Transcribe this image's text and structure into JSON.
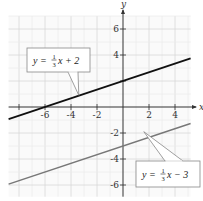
{
  "chart_data": {
    "type": "line",
    "title": "",
    "xlabel": "x",
    "ylabel": "y",
    "xlim": [
      -8.8,
      5.2
    ],
    "ylim": [
      -6.9,
      7
    ],
    "grid": true,
    "x_ticks": [
      -8,
      -6,
      -4,
      -2,
      2,
      4
    ],
    "x_tick_labels": [
      "-6",
      "-4",
      "-2",
      "2",
      "4"
    ],
    "x_tick_label_values": [
      -6,
      -4,
      -2,
      2,
      4
    ],
    "y_ticks": [
      -6,
      -4,
      -2,
      2,
      4,
      6
    ],
    "y_tick_labels": [
      "6",
      "4",
      "-2",
      "-4",
      "-6"
    ],
    "y_tick_label_values": [
      6,
      4,
      -2,
      -4,
      -6
    ],
    "series": [
      {
        "name": "y = 1/3 x + 2",
        "slope": 0.3333,
        "intercept": 2,
        "x": [
          -8.8,
          5.2
        ],
        "color": "#111111",
        "label": {
          "prefix": "y = ",
          "num": "1",
          "den": "3",
          "suffix": "x + 2",
          "anchor": [
            -3.4,
            0.9
          ]
        }
      },
      {
        "name": "y = 1/3 x - 3",
        "slope": 0.3333,
        "intercept": -3,
        "x": [
          -8.8,
          5.2
        ],
        "color": "#777777",
        "label": {
          "prefix": "y = ",
          "num": "1",
          "den": "3",
          "suffix": "x − 3",
          "anchor": [
            1.6,
            -1.9
          ]
        }
      }
    ]
  }
}
